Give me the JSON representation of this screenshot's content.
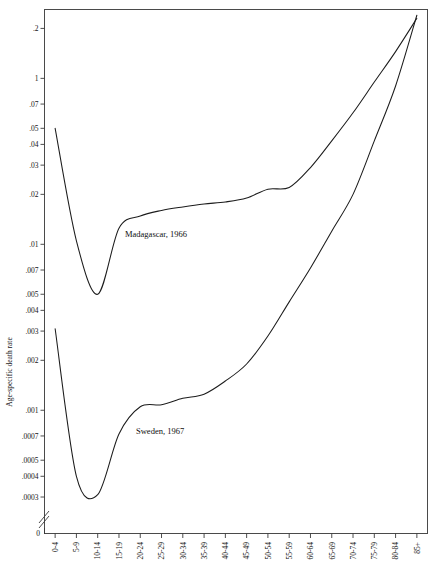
{
  "chart_data": {
    "type": "line",
    "title": "",
    "subtitle": "",
    "xlabel": "",
    "ylabel": "Age-specific death rate",
    "yscale": "log",
    "ygrid": false,
    "xgrid": false,
    "legend_position": "inline-annotation",
    "axis_break": true,
    "axis_break_note": "y-axis broken between 0 and .0003",
    "categories": [
      "0-4",
      "5-9",
      "10-14",
      "15-19",
      "20-24",
      "25-29",
      "30-34",
      "35-39",
      "40-44",
      "45-49",
      "50-54",
      "55-59",
      "60-64",
      "65-69",
      "70-74",
      "75-79",
      "80-84",
      "85+"
    ],
    "ytick_labels": [
      "0",
      ".0003",
      ".0004",
      ".0005",
      ".0007",
      ".001",
      ".002",
      ".003",
      ".004",
      ".005",
      ".007",
      ".01",
      ".02",
      ".03",
      ".04",
      ".05",
      ".07",
      "1",
      ".2"
    ],
    "ytick_values": [
      0.0003,
      0.0004,
      0.0005,
      0.0007,
      0.001,
      0.002,
      0.003,
      0.004,
      0.005,
      0.007,
      0.01,
      0.02,
      0.03,
      0.04,
      0.05,
      0.07,
      0.1,
      0.2
    ],
    "ylim": [
      0.0003,
      0.26
    ],
    "series": [
      {
        "name": "Madagascar, 1966",
        "label": "Madagascar, 1966",
        "color": "#1c1c1c",
        "values": [
          0.05,
          0.0105,
          0.005,
          0.0125,
          0.0148,
          0.016,
          0.0168,
          0.0175,
          0.018,
          0.019,
          0.0215,
          0.022,
          0.029,
          0.042,
          0.062,
          0.095,
          0.145,
          0.23
        ]
      },
      {
        "name": "Sweden, 1967",
        "label": "Sweden, 1967",
        "color": "#1c1c1c",
        "values": [
          0.0031,
          0.0004,
          0.00031,
          0.00072,
          0.00105,
          0.00108,
          0.00118,
          0.00125,
          0.0015,
          0.0019,
          0.0028,
          0.0045,
          0.0072,
          0.012,
          0.02,
          0.042,
          0.09,
          0.24
        ]
      }
    ],
    "annotations": [
      {
        "text": "Madagascar, 1966",
        "x_px": 125,
        "y_px": 237
      },
      {
        "text": "Sweden, 1967",
        "x_px": 136,
        "y_px": 434
      }
    ]
  }
}
